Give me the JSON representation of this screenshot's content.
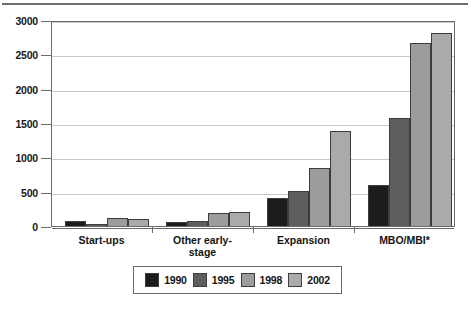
{
  "chart_data": {
    "type": "bar",
    "title": "£ million",
    "xlabel": "",
    "ylabel": "",
    "ylim": [
      0,
      3000
    ],
    "ytick_step": 500,
    "yticks": [
      0,
      500,
      1000,
      1500,
      2000,
      2500,
      3000
    ],
    "ytick_labels": [
      "0",
      "500",
      "1000",
      "1500",
      "2000",
      "2500",
      "3000"
    ],
    "grid": true,
    "legend_position": "bottom",
    "categories": [
      "Start-ups",
      "Other early-\nstage",
      "Expansion",
      "MBO/MBI*"
    ],
    "series": [
      {
        "name": "1990",
        "color": "#1c1c1c",
        "values": [
          80,
          55,
          405,
          600
        ]
      },
      {
        "name": "1995",
        "color": "#5e5e5e",
        "values": [
          25,
          70,
          510,
          1570
        ]
      },
      {
        "name": "1998",
        "color": "#9c9c9c",
        "values": [
          115,
          185,
          840,
          2670
        ]
      },
      {
        "name": "2002",
        "color": "#aaaaaa",
        "values": [
          100,
          200,
          1385,
          2810
        ]
      }
    ]
  },
  "figure": {
    "title": "£ million",
    "axis": {
      "y_tick_labels": [
        "3000",
        "2500",
        "2000",
        "1500",
        "1000",
        "500",
        "0"
      ],
      "x_group_labels": [
        "Start-ups",
        "Other early-\nstage",
        "Expansion",
        "MBO/MBI*"
      ]
    },
    "legend": {
      "entries": [
        {
          "label": "1990",
          "color": "#1c1c1c"
        },
        {
          "label": "1995",
          "color": "#5e5e5e"
        },
        {
          "label": "1998",
          "color": "#9c9c9c"
        },
        {
          "label": "2002",
          "color": "#aaaaaa"
        }
      ]
    }
  }
}
